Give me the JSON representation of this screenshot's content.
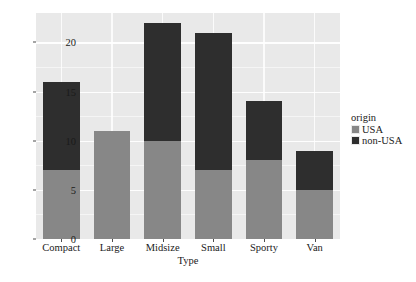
{
  "chart_data": {
    "type": "bar",
    "stacked": true,
    "title": "",
    "xlabel": "Type",
    "ylabel": "count",
    "categories": [
      "Compact",
      "Large",
      "Midsize",
      "Small",
      "Sporty",
      "Van"
    ],
    "series": [
      {
        "name": "USA",
        "color": "#878787",
        "values": [
          7,
          11,
          10,
          7,
          8,
          5
        ]
      },
      {
        "name": "non-USA",
        "color": "#2e2e2e",
        "values": [
          9,
          0,
          12,
          14,
          6,
          4
        ]
      }
    ],
    "totals": [
      16,
      11,
      22,
      21,
      14,
      9
    ],
    "ylim": [
      0,
      23
    ],
    "yticks": [
      0,
      5,
      10,
      15,
      20
    ],
    "ytick_labels": [
      "0",
      "5",
      "10",
      "15",
      "20"
    ],
    "grid": true,
    "grid_color": "#ffffff",
    "panel_color": "#e9e9e9",
    "legend": {
      "title": "origin",
      "position": "right",
      "entries": [
        {
          "label": "USA",
          "color": "#878787"
        },
        {
          "label": "non-USA",
          "color": "#2e2e2e"
        }
      ]
    }
  }
}
